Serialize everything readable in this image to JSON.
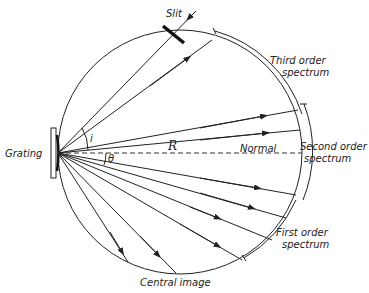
{
  "figure": {
    "type": "concave grating Rowland circle diagram",
    "labels": {
      "slit": "Slit",
      "grating": "Grating",
      "radius": "R",
      "normal": "Normal",
      "angle_i": "i",
      "angle_theta": "θ",
      "third_order": [
        "Third order",
        "spectrum"
      ],
      "second_order": [
        "Second order",
        "spectrum"
      ],
      "first_order": [
        "First order",
        "spectrum"
      ],
      "central_image": "Central image"
    },
    "colors": {
      "line": "#222222",
      "background": "#ffffff"
    }
  }
}
